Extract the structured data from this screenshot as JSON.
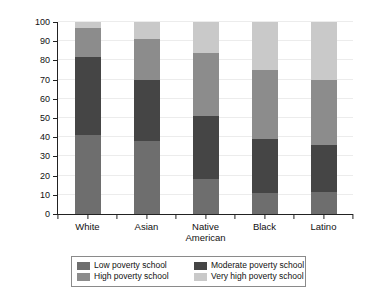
{
  "chart_data": {
    "type": "bar",
    "subtype": "stacked-bar-100",
    "title": "",
    "xlabel": "",
    "ylabel": "Percent of Students",
    "ylim": [
      0,
      100
    ],
    "ytick_step": 10,
    "yticks": [
      "0",
      "10",
      "20",
      "30",
      "40",
      "50",
      "60",
      "70",
      "80",
      "90",
      "100"
    ],
    "grid": true,
    "legend_position": "bottom",
    "categories": [
      "White",
      "Asian",
      "Native American",
      "Black",
      "Latino"
    ],
    "category_lines": [
      [
        "White"
      ],
      [
        "Asian"
      ],
      [
        "Native",
        "American"
      ],
      [
        "Black"
      ],
      [
        "Latino"
      ]
    ],
    "series": [
      {
        "name": "Low poverty school",
        "color": "#6e6e6e",
        "values": [
          41,
          38,
          18,
          11,
          11.5
        ]
      },
      {
        "name": "Moderate poverty school",
        "color": "#454545",
        "values": [
          41,
          32,
          33,
          28,
          24.5
        ]
      },
      {
        "name": "High poverty school",
        "color": "#8c8c8c",
        "values": [
          15,
          21,
          33,
          36,
          34
        ]
      },
      {
        "name": "Very high poverty school",
        "color": "#c9c9c9",
        "values": [
          3,
          9,
          16,
          25,
          30
        ]
      }
    ],
    "cumulative_tops": [
      [
        41,
        82,
        97,
        100
      ],
      [
        38,
        70,
        91,
        100
      ],
      [
        18,
        51,
        84,
        100
      ],
      [
        11,
        39,
        75,
        100
      ],
      [
        11.5,
        36,
        70,
        100
      ]
    ]
  },
  "legend": {
    "items": [
      {
        "label": "Low poverty school",
        "color": "#6e6e6e"
      },
      {
        "label": "Moderate poverty school",
        "color": "#454545"
      },
      {
        "label": "High poverty school",
        "color": "#8c8c8c"
      },
      {
        "label": "Very high poverty school",
        "color": "#c9c9c9"
      }
    ]
  },
  "colors": {
    "axis": "#222222",
    "grid": "#ececec",
    "background": "#ffffff",
    "legend_border": "#8a8a8a"
  }
}
